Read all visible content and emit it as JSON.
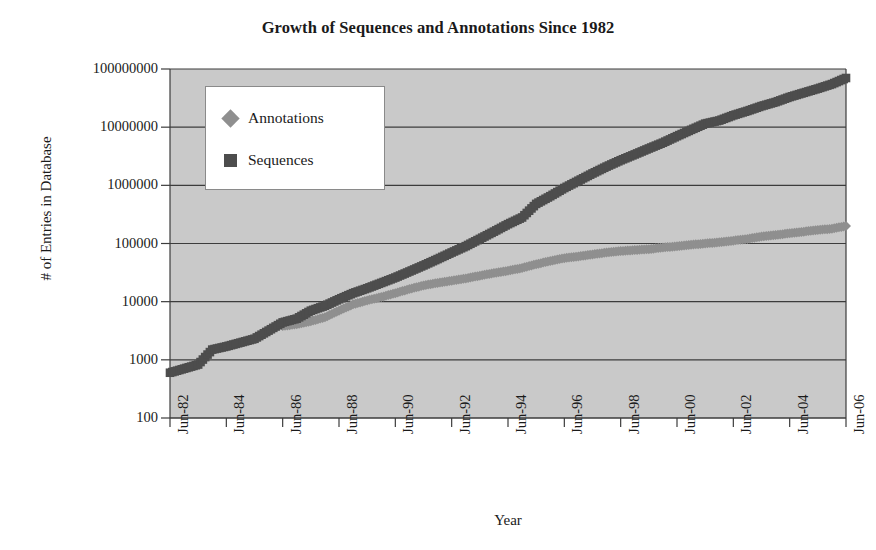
{
  "chart_data": {
    "type": "scatter",
    "title": "Growth of Sequences and Annotations Since 1982",
    "xlabel": "Year",
    "ylabel": "# of Entries in Database",
    "yscale": "log",
    "ylim": [
      100,
      100000000
    ],
    "ytick_labels": [
      "100000000",
      "10000000",
      "1000000",
      "100000",
      "10000",
      "1000",
      "100"
    ],
    "ytick_values": [
      100000000,
      10000000,
      1000000,
      100000,
      10000,
      1000,
      100
    ],
    "xtick_labels": [
      "Jun-82",
      "Jun-84",
      "Jun-86",
      "Jun-88",
      "Jun-90",
      "Jun-92",
      "Jun-94",
      "Jun-96",
      "Jun-98",
      "Jun-00",
      "Jun-02",
      "Jun-04",
      "Jun-06"
    ],
    "xlim": [
      "Jun-82",
      "Jun-06"
    ],
    "grid": true,
    "grid_axis": "y",
    "legend_position": "upper-left-inside",
    "plot_background": "#c9c9c9",
    "series": [
      {
        "name": "Annotations",
        "marker": "diamond",
        "color": "#8f8f8f",
        "points": [
          {
            "x": "Jun-86",
            "y": 3800
          },
          {
            "x": "Dec-86",
            "y": 4100
          },
          {
            "x": "Jun-87",
            "y": 4600
          },
          {
            "x": "Dec-87",
            "y": 5400
          },
          {
            "x": "Jun-88",
            "y": 7000
          },
          {
            "x": "Dec-88",
            "y": 9000
          },
          {
            "x": "Jun-89",
            "y": 10500
          },
          {
            "x": "Dec-89",
            "y": 12000
          },
          {
            "x": "Jun-90",
            "y": 14000
          },
          {
            "x": "Dec-90",
            "y": 16500
          },
          {
            "x": "Jun-91",
            "y": 19000
          },
          {
            "x": "Dec-91",
            "y": 21000
          },
          {
            "x": "Jun-92",
            "y": 23000
          },
          {
            "x": "Dec-92",
            "y": 25000
          },
          {
            "x": "Jun-93",
            "y": 28000
          },
          {
            "x": "Dec-93",
            "y": 31000
          },
          {
            "x": "Jun-94",
            "y": 34000
          },
          {
            "x": "Dec-94",
            "y": 38000
          },
          {
            "x": "Jun-95",
            "y": 44000
          },
          {
            "x": "Dec-95",
            "y": 50000
          },
          {
            "x": "Jun-96",
            "y": 56000
          },
          {
            "x": "Dec-96",
            "y": 60000
          },
          {
            "x": "Jun-97",
            "y": 65000
          },
          {
            "x": "Dec-97",
            "y": 70000
          },
          {
            "x": "Jun-98",
            "y": 74000
          },
          {
            "x": "Dec-98",
            "y": 77000
          },
          {
            "x": "Jun-99",
            "y": 80000
          },
          {
            "x": "Dec-99",
            "y": 85000
          },
          {
            "x": "Jun-00",
            "y": 90000
          },
          {
            "x": "Dec-00",
            "y": 95000
          },
          {
            "x": "Jun-01",
            "y": 100000
          },
          {
            "x": "Dec-01",
            "y": 105000
          },
          {
            "x": "Jun-02",
            "y": 112000
          },
          {
            "x": "Dec-02",
            "y": 120000
          },
          {
            "x": "Jun-03",
            "y": 132000
          },
          {
            "x": "Dec-03",
            "y": 140000
          },
          {
            "x": "Jun-04",
            "y": 150000
          },
          {
            "x": "Dec-04",
            "y": 160000
          },
          {
            "x": "Jun-05",
            "y": 170000
          },
          {
            "x": "Dec-05",
            "y": 180000
          },
          {
            "x": "Jun-06",
            "y": 200000
          }
        ]
      },
      {
        "name": "Sequences",
        "marker": "square",
        "color": "#4d4d4d",
        "points": [
          {
            "x": "Jun-82",
            "y": 600
          },
          {
            "x": "Jun-83",
            "y": 830
          },
          {
            "x": "Dec-83",
            "y": 1500
          },
          {
            "x": "Jun-84",
            "y": 1700
          },
          {
            "x": "Jun-85",
            "y": 2300
          },
          {
            "x": "Jun-86",
            "y": 4400
          },
          {
            "x": "Dec-86",
            "y": 5100
          },
          {
            "x": "Jun-87",
            "y": 7000
          },
          {
            "x": "Dec-87",
            "y": 8500
          },
          {
            "x": "Jun-88",
            "y": 11000
          },
          {
            "x": "Dec-88",
            "y": 14000
          },
          {
            "x": "Jun-89",
            "y": 17000
          },
          {
            "x": "Dec-89",
            "y": 21000
          },
          {
            "x": "Jun-90",
            "y": 26000
          },
          {
            "x": "Dec-90",
            "y": 33000
          },
          {
            "x": "Jun-91",
            "y": 42000
          },
          {
            "x": "Dec-91",
            "y": 54000
          },
          {
            "x": "Jun-92",
            "y": 70000
          },
          {
            "x": "Dec-92",
            "y": 90000
          },
          {
            "x": "Jun-93",
            "y": 120000
          },
          {
            "x": "Dec-93",
            "y": 160000
          },
          {
            "x": "Jun-94",
            "y": 215000
          },
          {
            "x": "Dec-94",
            "y": 280000
          },
          {
            "x": "Jun-95",
            "y": 480000
          },
          {
            "x": "Dec-95",
            "y": 650000
          },
          {
            "x": "Jun-96",
            "y": 900000
          },
          {
            "x": "Dec-96",
            "y": 1200000
          },
          {
            "x": "Jun-97",
            "y": 1600000
          },
          {
            "x": "Dec-97",
            "y": 2100000
          },
          {
            "x": "Jun-98",
            "y": 2700000
          },
          {
            "x": "Dec-98",
            "y": 3400000
          },
          {
            "x": "Jun-99",
            "y": 4300000
          },
          {
            "x": "Dec-99",
            "y": 5400000
          },
          {
            "x": "Jun-00",
            "y": 7000000
          },
          {
            "x": "Dec-00",
            "y": 9000000
          },
          {
            "x": "Jun-01",
            "y": 11500000
          },
          {
            "x": "Dec-01",
            "y": 13000000
          },
          {
            "x": "Jun-02",
            "y": 16000000
          },
          {
            "x": "Dec-02",
            "y": 19000000
          },
          {
            "x": "Jun-03",
            "y": 23000000
          },
          {
            "x": "Dec-03",
            "y": 27000000
          },
          {
            "x": "Jun-04",
            "y": 33000000
          },
          {
            "x": "Dec-04",
            "y": 39000000
          },
          {
            "x": "Jun-05",
            "y": 46000000
          },
          {
            "x": "Dec-05",
            "y": 55000000
          },
          {
            "x": "Jun-06",
            "y": 70000000
          }
        ]
      }
    ]
  }
}
